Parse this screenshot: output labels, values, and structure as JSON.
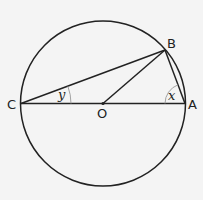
{
  "diagram": {
    "type": "circle-geometry",
    "labels": {
      "C": "C",
      "O": "O",
      "A": "A",
      "B": "B"
    },
    "angles": {
      "x": "x",
      "y": "y"
    },
    "colors": {
      "stroke": "#222222",
      "arc": "#888888",
      "background": "#f4f4f4"
    }
  }
}
